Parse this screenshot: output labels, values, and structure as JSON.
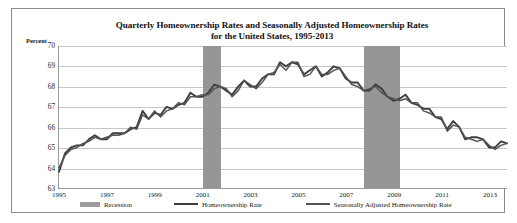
{
  "chart_data": {
    "type": "line",
    "title": "Quarterly Homeownership Rates and Seasonally Adjusted Homeownership Rates for the United States, 1995-2013",
    "title_line1": "Quarterly Homeownership Rates and Seasonally Adjusted Homeownership Rates",
    "title_line2": "for the United States, 1995-2013",
    "xlabel": "",
    "ylabel": "Percent",
    "ylim": [
      63,
      70
    ],
    "yticks": [
      70,
      69,
      68,
      67,
      66,
      65,
      64,
      63
    ],
    "xlim": [
      "1995 Q1",
      "2013 Q4"
    ],
    "xticks": [
      "1995",
      "1997",
      "1999",
      "2001",
      "2003",
      "2005",
      "2007",
      "2009",
      "2011",
      "2013"
    ],
    "grid": "horizontal",
    "legend_position": "bottom",
    "x": [
      "1995 Q1",
      "1995 Q2",
      "1995 Q3",
      "1995 Q4",
      "1996 Q1",
      "1996 Q2",
      "1996 Q3",
      "1996 Q4",
      "1997 Q1",
      "1997 Q2",
      "1997 Q3",
      "1997 Q4",
      "1998 Q1",
      "1998 Q2",
      "1998 Q3",
      "1998 Q4",
      "1999 Q1",
      "1999 Q2",
      "1999 Q3",
      "1999 Q4",
      "2000 Q1",
      "2000 Q2",
      "2000 Q3",
      "2000 Q4",
      "2001 Q1",
      "2001 Q2",
      "2001 Q3",
      "2001 Q4",
      "2002 Q1",
      "2002 Q2",
      "2002 Q3",
      "2002 Q4",
      "2003 Q1",
      "2003 Q2",
      "2003 Q3",
      "2003 Q4",
      "2004 Q1",
      "2004 Q2",
      "2004 Q3",
      "2004 Q4",
      "2005 Q1",
      "2005 Q2",
      "2005 Q3",
      "2005 Q4",
      "2006 Q1",
      "2006 Q2",
      "2006 Q3",
      "2006 Q4",
      "2007 Q1",
      "2007 Q2",
      "2007 Q3",
      "2007 Q4",
      "2008 Q1",
      "2008 Q2",
      "2008 Q3",
      "2008 Q4",
      "2009 Q1",
      "2009 Q2",
      "2009 Q3",
      "2009 Q4",
      "2010 Q1",
      "2010 Q2",
      "2010 Q3",
      "2010 Q4",
      "2011 Q1",
      "2011 Q2",
      "2011 Q3",
      "2011 Q4",
      "2012 Q1",
      "2012 Q2",
      "2012 Q3",
      "2012 Q4",
      "2013 Q1",
      "2013 Q2",
      "2013 Q3",
      "2013 Q4"
    ],
    "series": [
      {
        "name": "Homeownership Rate",
        "color": "#3d3d3d",
        "values": [
          63.8,
          64.7,
          65.0,
          65.1,
          65.1,
          65.4,
          65.6,
          65.4,
          65.4,
          65.7,
          65.7,
          65.7,
          65.9,
          66.0,
          66.8,
          66.4,
          66.7,
          66.6,
          67.0,
          66.9,
          67.1,
          67.2,
          67.7,
          67.5,
          67.5,
          67.7,
          68.1,
          68.0,
          67.8,
          67.6,
          68.0,
          68.3,
          68.0,
          68.0,
          68.4,
          68.6,
          68.6,
          69.2,
          69.0,
          69.2,
          69.1,
          68.6,
          68.8,
          69.0,
          68.5,
          68.7,
          69.0,
          68.9,
          68.4,
          68.2,
          68.2,
          67.8,
          67.8,
          68.1,
          67.9,
          67.5,
          67.3,
          67.4,
          67.6,
          67.2,
          67.1,
          66.9,
          66.9,
          66.5,
          66.4,
          65.9,
          66.3,
          66.0,
          65.4,
          65.5,
          65.5,
          65.4,
          65.0,
          65.0,
          65.3,
          65.2
        ]
      },
      {
        "name": "Seasonally Adjusted Homeownership Rate",
        "color": "#555555",
        "values": [
          64.0,
          64.6,
          64.9,
          65.0,
          65.2,
          65.3,
          65.5,
          65.4,
          65.5,
          65.6,
          65.6,
          65.7,
          66.0,
          65.9,
          66.6,
          66.4,
          66.8,
          66.5,
          66.8,
          66.9,
          67.2,
          67.1,
          67.5,
          67.5,
          67.6,
          67.6,
          67.9,
          68.0,
          67.9,
          67.5,
          67.8,
          68.3,
          68.1,
          67.9,
          68.2,
          68.6,
          68.7,
          69.1,
          68.8,
          69.2,
          69.2,
          68.5,
          68.6,
          69.0,
          68.6,
          68.6,
          68.8,
          68.9,
          68.5,
          68.1,
          68.0,
          67.8,
          67.9,
          68.0,
          67.7,
          67.5,
          67.4,
          67.3,
          67.4,
          67.2,
          67.2,
          66.8,
          66.7,
          66.5,
          66.5,
          65.8,
          66.1,
          66.0,
          65.5,
          65.4,
          65.3,
          65.4,
          65.1,
          64.9,
          65.1,
          65.2
        ]
      }
    ],
    "recession_bands": [
      {
        "label": "Recession",
        "start": "2001 Q1",
        "end": "2001 Q4",
        "color": "#969696"
      },
      {
        "label": "Recession",
        "start": "2007 Q4",
        "end": "2009 Q2",
        "color": "#969696"
      }
    ],
    "legend": [
      {
        "label": "Recession",
        "marker": "box",
        "color": "#969696"
      },
      {
        "label": "Homeownership Rate",
        "marker": "line",
        "color": "#3d3d3d"
      },
      {
        "label": "Seasonally Adjusted Homeownership Rate",
        "marker": "line",
        "color": "#555555"
      }
    ]
  }
}
